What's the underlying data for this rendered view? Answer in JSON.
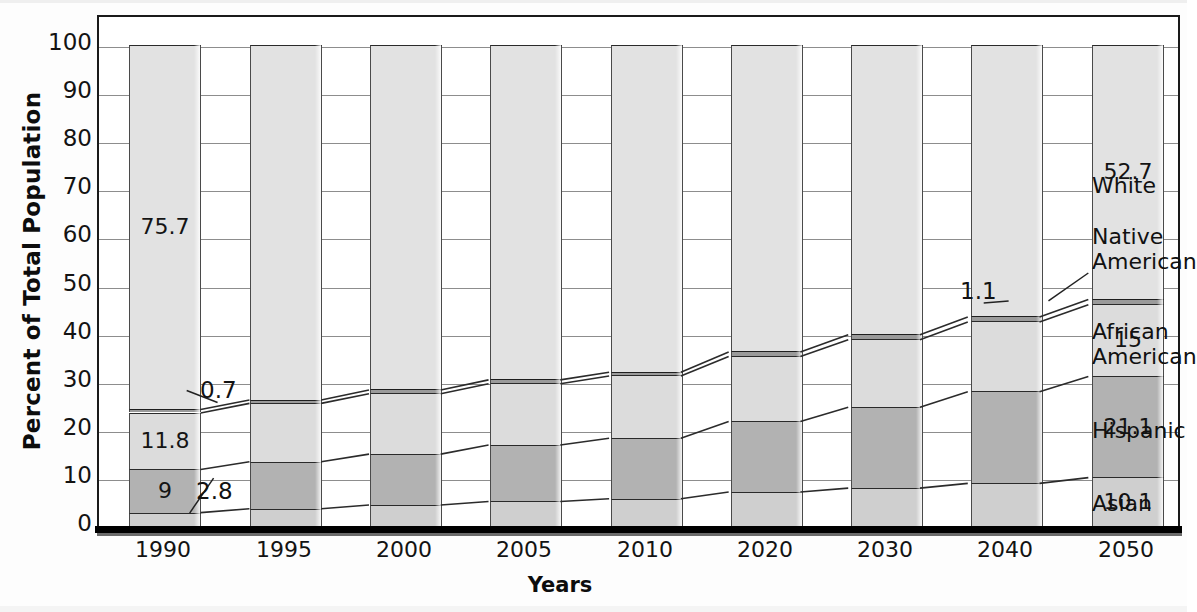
{
  "chart_data": {
    "type": "bar",
    "subtype": "stacked-bar-100",
    "title": "",
    "xlabel": "Years",
    "ylabel": "Percent of Total Population",
    "ylim": [
      0,
      100
    ],
    "ytick_step": 10,
    "ytick_labels": [
      "0",
      "10",
      "20",
      "30",
      "40",
      "50",
      "60",
      "70",
      "80",
      "90",
      "100"
    ],
    "grid": true,
    "legend_position": "right-inline",
    "categories": [
      "1990",
      "1995",
      "2000",
      "2005",
      "2010",
      "2020",
      "2030",
      "2040",
      "2050"
    ],
    "stack_order_bottom_to_top": [
      "Asian",
      "Hispanic",
      "African American",
      "Native American",
      "White"
    ],
    "series": [
      {
        "name": "Asian",
        "values": [
          2.8,
          3.6,
          4.4,
          5.1,
          5.7,
          7.1,
          7.9,
          8.9,
          10.1
        ]
      },
      {
        "name": "Hispanic",
        "values": [
          9.0,
          9.8,
          10.6,
          11.8,
          12.6,
          14.7,
          16.9,
          19.1,
          21.1
        ]
      },
      {
        "name": "African American",
        "values": [
          11.8,
          12.2,
          12.6,
          12.8,
          13.0,
          13.6,
          14.1,
          14.6,
          15.0
        ]
      },
      {
        "name": "Native American",
        "values": [
          0.7,
          0.7,
          0.8,
          0.8,
          0.8,
          0.9,
          1.0,
          1.0,
          1.1
        ]
      },
      {
        "name": "White",
        "values": [
          75.7,
          73.7,
          71.6,
          69.5,
          67.9,
          63.7,
          60.1,
          56.4,
          52.7
        ]
      }
    ],
    "data_labels": {
      "1990": {
        "Asian": "2.8",
        "Hispanic": "9",
        "African American": "11.8",
        "Native American": "0.7",
        "White": "75.7"
      },
      "2050": {
        "Asian": "10.1",
        "Hispanic": "21.1",
        "African American": "15",
        "Native American": "1.1",
        "White": "52.7"
      }
    },
    "annotations": [
      {
        "text": "0.7",
        "series": "Native American",
        "category": "1990",
        "leader": true
      },
      {
        "text": "2.8",
        "series": "Asian",
        "category": "1990",
        "leader": true
      },
      {
        "text": "1.1",
        "series": "Native American",
        "category": "2050",
        "leader": true
      },
      {
        "text": "Native American",
        "series": "Native American",
        "category": "2050",
        "leader": true
      }
    ],
    "legend_entries": [
      "White",
      "Native American",
      "African American",
      "Hispanic",
      "Asian"
    ],
    "colors": {
      "white_seg": "#e2e2e2",
      "native_american_seg": "#9a9a9a",
      "african_american_seg": "#dcdcdc",
      "hispanic_seg": "#b2b2b2",
      "asian_seg": "#cfcfcf",
      "axis": "#1a1a1a",
      "grid": "#8d8d8d",
      "text": "#121212"
    }
  },
  "axes": {
    "y_title": "Percent of Total Population",
    "x_title": "Years",
    "y_ticks": [
      "100",
      "90",
      "80",
      "70",
      "60",
      "50",
      "40",
      "30",
      "20",
      "10",
      "0"
    ],
    "x_ticks": [
      "1990",
      "1995",
      "2000",
      "2005",
      "2010",
      "2020",
      "2030",
      "2040",
      "2050"
    ]
  },
  "legend": {
    "white": "White",
    "native_american": "Native\nAmerican",
    "african_american": "African\nAmerican",
    "hispanic": "Hispanic",
    "asian": "Asian"
  },
  "callouts": {
    "c_1990_native": "0.7",
    "c_1990_asian": "2.8",
    "c_2050_native": "1.1"
  },
  "bar_labels": {
    "y1990_white": "75.7",
    "y1990_african": "11.8",
    "y1990_hispanic": "9",
    "y2050_white": "52.7",
    "y2050_african": "15",
    "y2050_hispanic": "21.1",
    "y2050_asian": "10.1"
  }
}
